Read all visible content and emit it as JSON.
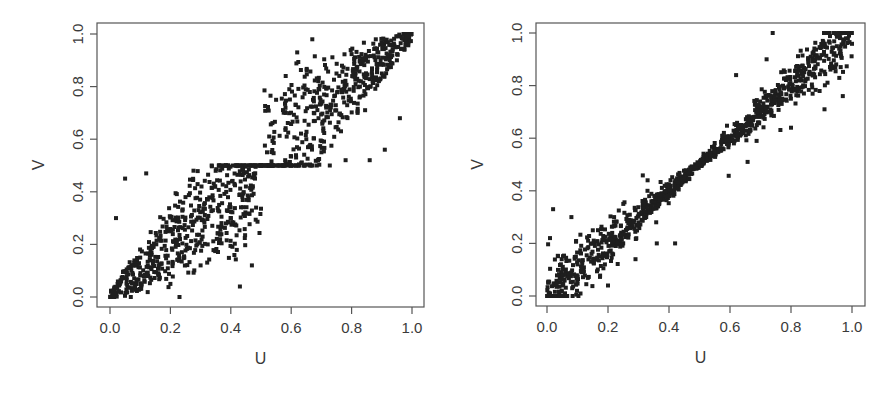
{
  "chart_data": [
    {
      "type": "scatter",
      "title": "",
      "xlabel": "U",
      "ylabel": "V",
      "xlim": [
        -0.04,
        1.04
      ],
      "ylim": [
        -0.04,
        1.04
      ],
      "xticks": [
        "0.0",
        "0.2",
        "0.4",
        "0.6",
        "0.8",
        "1.0"
      ],
      "yticks": [
        "0.0",
        "0.2",
        "0.4",
        "0.6",
        "0.8",
        "1.0"
      ],
      "grid": false,
      "legend": null,
      "n_points": 1000,
      "description": "Two-block pattern: points fill [0,0.5]x[0,0.5] and [0.5,1]x[0.5,1], denser toward the diagonal, pinched at (0.5,0.5)",
      "sample_points": [
        [
          0.01,
          0.02
        ],
        [
          0.02,
          0.3
        ],
        [
          0.05,
          0.45
        ],
        [
          0.1,
          0.15
        ],
        [
          0.12,
          0.47
        ],
        [
          0.2,
          0.05
        ],
        [
          0.23,
          0.0
        ],
        [
          0.25,
          0.38
        ],
        [
          0.3,
          0.12
        ],
        [
          0.35,
          0.48
        ],
        [
          0.4,
          0.3
        ],
        [
          0.43,
          0.04
        ],
        [
          0.45,
          0.42
        ],
        [
          0.47,
          0.12
        ],
        [
          0.48,
          0.45
        ],
        [
          0.5,
          0.5
        ],
        [
          0.52,
          0.55
        ],
        [
          0.55,
          0.75
        ],
        [
          0.58,
          0.52
        ],
        [
          0.62,
          0.93
        ],
        [
          0.65,
          0.6
        ],
        [
          0.67,
          0.98
        ],
        [
          0.7,
          0.55
        ],
        [
          0.75,
          0.85
        ],
        [
          0.78,
          0.52
        ],
        [
          0.82,
          0.7
        ],
        [
          0.86,
          0.52
        ],
        [
          0.88,
          0.98
        ],
        [
          0.91,
          0.56
        ],
        [
          0.95,
          0.9
        ],
        [
          0.96,
          0.68
        ],
        [
          0.99,
          0.99
        ]
      ]
    },
    {
      "type": "scatter",
      "title": "",
      "xlabel": "U",
      "ylabel": "V",
      "xlim": [
        -0.04,
        1.04
      ],
      "ylim": [
        -0.04,
        1.04
      ],
      "xticks": [
        "0.0",
        "0.2",
        "0.4",
        "0.6",
        "0.8",
        "1.0"
      ],
      "yticks": [
        "0.0",
        "0.2",
        "0.4",
        "0.6",
        "0.8",
        "1.0"
      ],
      "grid": false,
      "legend": null,
      "n_points": 1000,
      "description": "Tight band along V=U, narrowest near 0.5, widening toward both ends",
      "sample_points": [
        [
          0.01,
          0.01
        ],
        [
          0.02,
          0.33
        ],
        [
          0.01,
          0.22
        ],
        [
          0.05,
          0.1
        ],
        [
          0.08,
          0.3
        ],
        [
          0.1,
          0.12
        ],
        [
          0.15,
          0.25
        ],
        [
          0.2,
          0.04
        ],
        [
          0.22,
          0.3
        ],
        [
          0.25,
          0.35
        ],
        [
          0.29,
          0.14
        ],
        [
          0.3,
          0.28
        ],
        [
          0.33,
          0.44
        ],
        [
          0.36,
          0.2
        ],
        [
          0.4,
          0.38
        ],
        [
          0.42,
          0.2
        ],
        [
          0.45,
          0.45
        ],
        [
          0.5,
          0.5
        ],
        [
          0.55,
          0.55
        ],
        [
          0.58,
          0.62
        ],
        [
          0.62,
          0.84
        ],
        [
          0.65,
          0.65
        ],
        [
          0.7,
          0.72
        ],
        [
          0.72,
          0.9
        ],
        [
          0.74,
          1.0
        ],
        [
          0.8,
          0.64
        ],
        [
          0.82,
          0.84
        ],
        [
          0.88,
          0.9
        ],
        [
          0.91,
          0.71
        ],
        [
          0.95,
          0.95
        ],
        [
          0.97,
          0.76
        ],
        [
          0.99,
          0.99
        ]
      ]
    }
  ],
  "panels": [
    {
      "frame": {
        "left": 97,
        "top": 23,
        "right": 424,
        "bottom": 307
      },
      "x0px": 110,
      "x1px": 412,
      "y0px": 297,
      "y1px": 34,
      "xlabel": "U",
      "ylabel": "V",
      "xticks": [
        "0.0",
        "0.2",
        "0.4",
        "0.6",
        "0.8",
        "1.0"
      ],
      "yticks": [
        "0.0",
        "0.2",
        "0.4",
        "0.6",
        "0.8",
        "1.0"
      ],
      "pattern": "blocks",
      "seed": 7,
      "n": 1000
    },
    {
      "frame": {
        "left": 536,
        "top": 23,
        "right": 865,
        "bottom": 306
      },
      "x0px": 547,
      "x1px": 852,
      "y0px": 296,
      "y1px": 33,
      "xlabel": "U",
      "ylabel": "V",
      "xticks": [
        "0.0",
        "0.2",
        "0.4",
        "0.6",
        "0.8",
        "1.0"
      ],
      "yticks": [
        "0.0",
        "0.2",
        "0.4",
        "0.6",
        "0.8",
        "1.0"
      ],
      "pattern": "band",
      "seed": 13,
      "n": 1000
    }
  ],
  "colors": {
    "point": "#1e1e1e",
    "axis": "#555555",
    "text": "#3a3a3a"
  }
}
